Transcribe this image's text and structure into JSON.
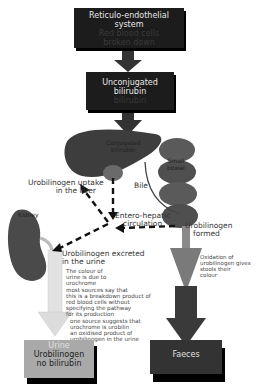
{
  "diagram": {
    "top_box": {
      "title_line1": "Reticulo-endothelial",
      "title_line2": "system",
      "sub_line1": "Red blood cells",
      "sub_line2": "broken down"
    },
    "unconj_box": {
      "line1": "Unconjugated",
      "line2": "bilirubin",
      "sub": "bilirubin"
    },
    "liver": {
      "label_line1": "Conjugated",
      "label_line2": "bilirubin"
    },
    "small_bowel": {
      "line1": "Small",
      "line2": "bowel"
    },
    "bile_label": "Bile",
    "uptake_label": {
      "line1": "Urobilinogen uptake",
      "line2": "in the liver"
    },
    "kidney_label": "Kidney",
    "entero_label": {
      "line1": "Entero-hepatic",
      "line2": "circulation"
    },
    "urob_formed": {
      "line1": "Urobilinogen",
      "line2": "formed"
    },
    "oxidation_note": [
      "Oxidation of",
      "urobilinogen gives",
      "stools their",
      "colour"
    ],
    "excreted_label": {
      "line1": "Urobilinogen excreted",
      "line2": "in the urine"
    },
    "urine_note": [
      "The colour of",
      "urine is due to",
      "urochrome",
      "most sources say that",
      "this is a breakdown product of",
      "red blood cells without",
      "specifying the pathway",
      "for its production",
      "one source suggests that",
      "urochrome is urobilin",
      "an oxidised product of",
      "urobilinogen in the urine"
    ],
    "urine_box": {
      "title": "Urine",
      "line1": "Urobilinogen",
      "line2": "no bilirubin"
    },
    "faeces_box": {
      "title": "Faeces"
    },
    "colors": {
      "box_dark": "#1c1c1c",
      "urine_box": "#a9a9a9",
      "faeces_box": "#333333",
      "liver": "#3d3d3d",
      "kidney": "#4a4a4a",
      "bowel": "#5a5a5a",
      "urine_arrow": "#dcdcdc",
      "faeces_arrow_light": "#7a7a7a",
      "faeces_arrow_dark": "#3a3a3a"
    }
  }
}
